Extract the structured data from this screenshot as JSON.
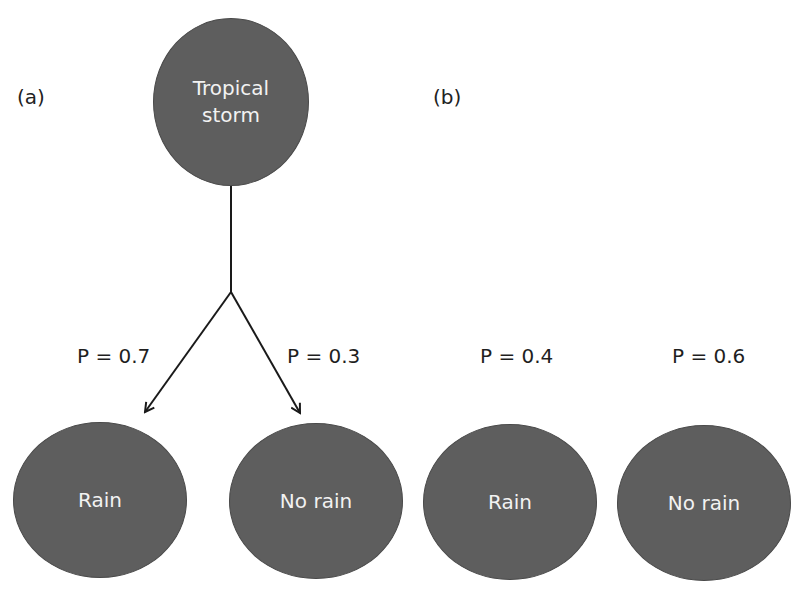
{
  "diagram": {
    "panels": [
      {
        "id": "a",
        "label": "(a)",
        "root": {
          "label": "Tropical\nstorm"
        },
        "children": [
          {
            "label": "Rain",
            "probability_label": "P = 0.7",
            "probability": 0.7
          },
          {
            "label": "No rain",
            "probability_label": "P = 0.3",
            "probability": 0.3
          }
        ],
        "edges": [
          {
            "from": "Tropical storm",
            "to": "Rain",
            "arrow": true
          },
          {
            "from": "Tropical storm",
            "to": "No rain",
            "arrow": true
          }
        ]
      },
      {
        "id": "b",
        "label": "(b)",
        "children": [
          {
            "label": "Rain",
            "probability_label": "P = 0.4",
            "probability": 0.4
          },
          {
            "label": "No rain",
            "probability_label": "P = 0.6",
            "probability": 0.6
          }
        ]
      }
    ],
    "colors": {
      "node_fill": "#5e5e5e",
      "node_text": "#f2f2f2",
      "edge": "#1a1a1a",
      "background": "#ffffff"
    }
  }
}
